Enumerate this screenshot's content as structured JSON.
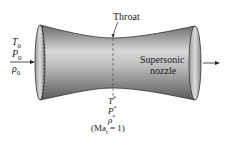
{
  "diagram": {
    "inlet": {
      "labels": [
        "T0",
        "P0",
        "ρ0"
      ],
      "T": "T",
      "P": "P",
      "rho": "ρ",
      "sub": "0"
    },
    "throat": {
      "label": "Throat",
      "labels": [
        "T*",
        "P*",
        "ρ*"
      ],
      "T": "T",
      "P": "P",
      "rho": "ρ",
      "sup": "*",
      "mach": "(Ma",
      "mach_sub": "t",
      "mach_eq": " = 1)"
    },
    "outlet": {
      "label_line1": "Supersonic",
      "label_line2": "nozzle"
    },
    "colors": {
      "body_dark": "#5a5a5a",
      "body_light": "#e6e6e6",
      "outline": "#333333",
      "arrow": "#222222"
    }
  }
}
